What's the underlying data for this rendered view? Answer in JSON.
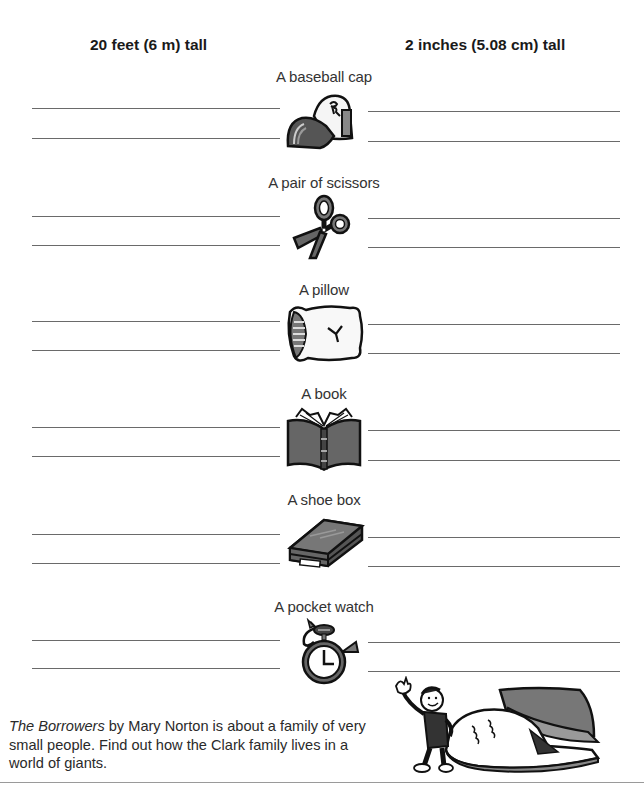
{
  "headers": {
    "left": "20 feet (6 m) tall",
    "right": "2 inches (5.08 cm) tall"
  },
  "items": [
    {
      "label": "A baseball cap",
      "icon": "baseball-cap-icon"
    },
    {
      "label": "A pair of scissors",
      "icon": "scissors-icon"
    },
    {
      "label": "A pillow",
      "icon": "pillow-icon"
    },
    {
      "label": "A book",
      "icon": "book-icon"
    },
    {
      "label": "A shoe box",
      "icon": "shoe-box-icon"
    },
    {
      "label": "A pocket watch",
      "icon": "pocket-watch-icon"
    }
  ],
  "caption": {
    "title": "The Borrowers",
    "text": " by Mary Norton is about a family of very small people.  Find out how the Clark family lives in a world of giants."
  },
  "illustration": "boy-beside-giant-shoe-illustration"
}
